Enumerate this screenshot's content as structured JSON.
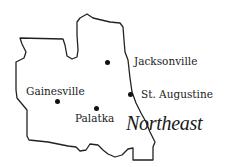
{
  "map": {
    "region_title": "Northeast",
    "outline_color": "#222222",
    "cities": [
      {
        "name": "Jacksonville",
        "dot": [
          107,
          62
        ],
        "label_pos": [
          134,
          56
        ]
      },
      {
        "name": "St. Augustine",
        "dot": [
          130,
          94
        ],
        "label_pos": [
          141,
          88
        ]
      },
      {
        "name": "Gainesville",
        "dot": [
          57,
          101
        ],
        "label_pos": [
          26,
          85
        ]
      },
      {
        "name": "Palatka",
        "dot": [
          96,
          108
        ],
        "label_pos": [
          75,
          113
        ]
      }
    ]
  }
}
